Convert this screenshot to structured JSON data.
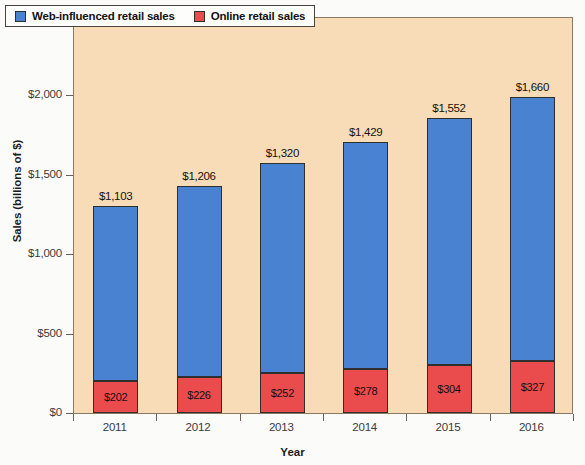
{
  "chart_data": {
    "type": "bar",
    "subtype": "stacked-vertical",
    "title": "",
    "xlabel": "Year",
    "ylabel": "Sales (billions of $)",
    "categories": [
      "2011",
      "2012",
      "2013",
      "2014",
      "2015",
      "2016"
    ],
    "series": [
      {
        "name": "Web-influenced retail sales",
        "color": "#4a82d2",
        "values": [
          1103,
          1206,
          1320,
          1429,
          1552,
          1660
        ],
        "labels": [
          "$1,103",
          "$1,206",
          "$1,320",
          "$1,429",
          "$1,552",
          "$1,660"
        ],
        "label_position": "above-bar"
      },
      {
        "name": "Online retail sales",
        "color": "#ea4b4d",
        "values": [
          202,
          226,
          252,
          278,
          304,
          327
        ],
        "labels": [
          "$202",
          "$226",
          "$252",
          "$278",
          "$304",
          "$327"
        ],
        "label_position": "inside-segment"
      }
    ],
    "stack_totals": [
      1305,
      1432,
      1572,
      1707,
      1856,
      1987
    ],
    "ylim": [
      0,
      2500
    ],
    "ytick_values": [
      0,
      500,
      1000,
      1500,
      2000,
      2500
    ],
    "ytick_labels": [
      "$0",
      "$500",
      "$1,000",
      "$1,500",
      "$2,000",
      "$2,500"
    ],
    "grid": false,
    "legend_position": "top-left",
    "plot_background": "#f7dcb7"
  },
  "legend": {
    "entries": [
      {
        "label": "Web-influenced retail sales",
        "color": "#4a82d2"
      },
      {
        "label": "Online retail sales",
        "color": "#ea4b4d"
      }
    ]
  },
  "axes": {
    "y_title": "Sales (billions of $)",
    "x_title": "Year"
  }
}
